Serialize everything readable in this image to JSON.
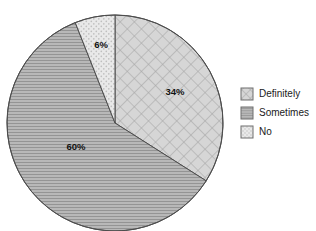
{
  "chart_data": {
    "type": "pie",
    "title": "",
    "categories": [
      "Definitely",
      "Sometimes",
      "No"
    ],
    "values": [
      34,
      60,
      6
    ],
    "value_labels": [
      "34%",
      "60%",
      "6%"
    ],
    "unit": "%",
    "start_angle_deg": 0,
    "direction": "clockwise",
    "legend_position": "right",
    "grid": false,
    "slices": [
      {
        "label": "Definitely",
        "value": 34,
        "value_label": "34%",
        "pattern": "diagonal-crosshatch",
        "fill_color": "#d4d4d4",
        "pattern_color": "#a8a8a8",
        "edge_color": "#4d4d4d",
        "start_deg": 0,
        "end_deg": 122.4,
        "label_x": 175,
        "label_y": 92
      },
      {
        "label": "Sometimes",
        "value": 60,
        "value_label": "60%",
        "pattern": "horizontal-lines",
        "fill_color": "#b5b5b5",
        "pattern_color": "#8f8f8f",
        "edge_color": "#4d4d4d",
        "start_deg": 122.4,
        "end_deg": 338.4,
        "label_x": 76,
        "label_y": 147
      },
      {
        "label": "No",
        "value": 6,
        "value_label": "6%",
        "pattern": "dots",
        "fill_color": "#e8e8e8",
        "pattern_color": "#bdbdbd",
        "edge_color": "#4d4d4d",
        "start_deg": 338.4,
        "end_deg": 360,
        "label_x": 101,
        "label_y": 45
      }
    ],
    "geometry": {
      "center_x": 115,
      "center_y": 123,
      "radius": 108
    }
  },
  "legend": {
    "items": [
      {
        "label": "Definitely",
        "swatch_y": 88,
        "text_y": 94
      },
      {
        "label": "Sometimes",
        "swatch_y": 107,
        "text_y": 113
      },
      {
        "label": "No",
        "swatch_y": 126,
        "text_y": 132
      }
    ],
    "swatch_x": 241,
    "swatch_size": 12,
    "text_x": 259
  },
  "colors": {
    "background": "#ffffff",
    "edge": "#4d4d4d",
    "text": "#1a1a1a",
    "definitely_fill": "#d4d4d4",
    "sometimes_fill": "#b5b5b5",
    "no_fill": "#e8e8e8"
  }
}
